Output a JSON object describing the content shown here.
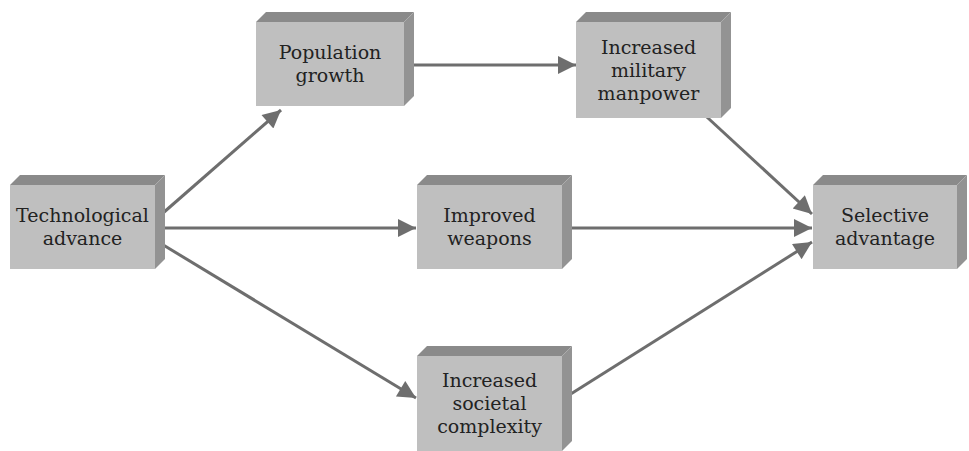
{
  "diagram": {
    "type": "flowchart",
    "colors": {
      "box_front": "#bfbfbf",
      "box_top": "#8a8a8a",
      "box_side": "#939393",
      "arrow": "#6e6e6e",
      "text": "#222222"
    },
    "nodes": [
      {
        "id": "tech",
        "label_lines": [
          "Technological",
          "advance"
        ],
        "x": 10,
        "y": 175,
        "w": 145,
        "h": 84
      },
      {
        "id": "pop",
        "label_lines": [
          "Population",
          "growth"
        ],
        "x": 256,
        "y": 12,
        "w": 148,
        "h": 84
      },
      {
        "id": "mil",
        "label_lines": [
          "Increased",
          "military",
          "manpower"
        ],
        "x": 576,
        "y": 12,
        "w": 145,
        "h": 96
      },
      {
        "id": "weap",
        "label_lines": [
          "Improved",
          "weapons"
        ],
        "x": 417,
        "y": 175,
        "w": 145,
        "h": 84
      },
      {
        "id": "soc",
        "label_lines": [
          "Increased",
          "societal",
          "complexity"
        ],
        "x": 417,
        "y": 346,
        "w": 145,
        "h": 95
      },
      {
        "id": "sel",
        "label_lines": [
          "Selective",
          "advantage"
        ],
        "x": 813,
        "y": 175,
        "w": 144,
        "h": 84
      }
    ],
    "edges": [
      {
        "from": "tech",
        "to": "pop",
        "x1": 163,
        "y1": 213,
        "x2": 281,
        "y2": 110
      },
      {
        "from": "tech",
        "to": "weap",
        "x1": 162,
        "y1": 228,
        "x2": 416,
        "y2": 228
      },
      {
        "from": "tech",
        "to": "soc",
        "x1": 160,
        "y1": 243,
        "x2": 416,
        "y2": 398
      },
      {
        "from": "pop",
        "to": "mil",
        "x1": 410,
        "y1": 65,
        "x2": 576,
        "y2": 65
      },
      {
        "from": "mil",
        "to": "sel",
        "x1": 696,
        "y1": 107,
        "x2": 812,
        "y2": 214
      },
      {
        "from": "weap",
        "to": "sel",
        "x1": 570,
        "y1": 228,
        "x2": 812,
        "y2": 228
      },
      {
        "from": "soc",
        "to": "sel",
        "x1": 566,
        "y1": 397,
        "x2": 812,
        "y2": 242
      }
    ]
  }
}
